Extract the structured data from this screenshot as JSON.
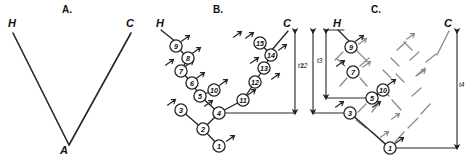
{
  "figure": {
    "caption_panels": [
      "A.",
      "B.",
      "C."
    ],
    "width": 471,
    "height": 166,
    "stroke_color": "#262626",
    "ghost_color": "#8c8c8c",
    "node_fill": "#ffffff"
  },
  "panelA": {
    "title": "A.",
    "title_pos": {
      "x": 62,
      "y": 6
    },
    "taxa": [
      {
        "name": "H",
        "x": 8,
        "y": 18
      },
      {
        "name": "C",
        "x": 126,
        "y": 18
      }
    ],
    "root": {
      "name": "A",
      "x": 64,
      "y": 148
    },
    "edges": [
      {
        "x1": 13,
        "y1": 33,
        "x2": 69,
        "y2": 145
      },
      {
        "x1": 69,
        "y1": 145,
        "x2": 131,
        "y2": 33
      }
    ]
  },
  "panelB": {
    "title": "B.",
    "title_pos": {
      "x": 213,
      "y": 6
    },
    "taxa": [
      {
        "name": "H",
        "x": 156,
        "y": 18
      },
      {
        "name": "C",
        "x": 283,
        "y": 18
      }
    ],
    "time_arrows": [
      {
        "label": "t1",
        "x": 295,
        "y_top": 30,
        "y_bottom": 113,
        "label_x": 298,
        "label_y": 66
      }
    ],
    "baseline": {
      "x1": 219,
      "y1": 113,
      "x2": 295,
      "y2": 113
    },
    "nodes": [
      {
        "id": 1,
        "x": 219,
        "y": 146
      },
      {
        "id": 2,
        "x": 203,
        "y": 129
      },
      {
        "id": 3,
        "x": 181,
        "y": 110
      },
      {
        "id": 4,
        "x": 219,
        "y": 113
      },
      {
        "id": 5,
        "x": 200,
        "y": 96
      },
      {
        "id": 6,
        "x": 192,
        "y": 83
      },
      {
        "id": 7,
        "x": 181,
        "y": 71
      },
      {
        "id": 8,
        "x": 188,
        "y": 58
      },
      {
        "id": 9,
        "x": 176,
        "y": 46
      },
      {
        "id": 10,
        "x": 214,
        "y": 90
      },
      {
        "id": 11,
        "x": 243,
        "y": 100
      },
      {
        "id": 12,
        "x": 255,
        "y": 82
      },
      {
        "id": 13,
        "x": 264,
        "y": 68
      },
      {
        "id": 14,
        "x": 271,
        "y": 55
      },
      {
        "id": 15,
        "x": 260,
        "y": 43
      }
    ],
    "edges": [
      {
        "from": 1,
        "to": 2
      },
      {
        "from": 2,
        "to": 3
      },
      {
        "from": 2,
        "to": 4
      },
      {
        "from": 4,
        "to": 5
      },
      {
        "from": 4,
        "to": 11
      },
      {
        "from": 5,
        "to": 6
      },
      {
        "from": 5,
        "to": 10
      },
      {
        "from": 6,
        "to": 7
      },
      {
        "from": 7,
        "to": 8
      },
      {
        "from": 8,
        "to": 9
      },
      {
        "from": 11,
        "to": 12
      },
      {
        "from": 12,
        "to": 13
      },
      {
        "from": 13,
        "to": 14
      },
      {
        "from": 14,
        "to": 15
      }
    ],
    "tip_edges": [
      {
        "x1": 176,
        "y1": 42,
        "x2": 161,
        "y2": 30,
        "leads_to": "H"
      },
      {
        "x1": 271,
        "y1": 51,
        "x2": 288,
        "y2": 31,
        "leads_to": "C"
      }
    ],
    "ticks": [
      {
        "x": 186,
        "y": 38
      },
      {
        "x": 197,
        "y": 50
      },
      {
        "x": 190,
        "y": 63
      },
      {
        "x": 201,
        "y": 75
      },
      {
        "x": 170,
        "y": 62
      },
      {
        "x": 172,
        "y": 102
      },
      {
        "x": 224,
        "y": 82
      },
      {
        "x": 209,
        "y": 103
      },
      {
        "x": 231,
        "y": 138
      },
      {
        "x": 252,
        "y": 92
      },
      {
        "x": 250,
        "y": 35
      },
      {
        "x": 276,
        "y": 76
      },
      {
        "x": 255,
        "y": 60
      },
      {
        "x": 283,
        "y": 47
      },
      {
        "x": 238,
        "y": 34
      }
    ]
  },
  "panelC": {
    "title": "C.",
    "title_pos": {
      "x": 371,
      "y": 6
    },
    "taxa": [
      {
        "name": "H",
        "x": 333,
        "y": 18
      },
      {
        "name": "C",
        "x": 444,
        "y": 18
      }
    ],
    "time_arrows": [
      {
        "label": "t2",
        "x": 313,
        "y_top": 30,
        "y_bottom": 113,
        "label_x": 303,
        "label_y": 66
      },
      {
        "label": "t3",
        "x": 326,
        "y_top": 30,
        "y_bottom": 98,
        "label_x": 318,
        "label_y": 61
      },
      {
        "label": "t4",
        "x": 457,
        "y_top": 30,
        "y_bottom": 148,
        "label_x": 459,
        "label_y": 85
      }
    ],
    "baselines": [
      {
        "x1": 313,
        "y1": 113,
        "x2": 350,
        "y2": 113
      },
      {
        "x1": 326,
        "y1": 98,
        "x2": 372,
        "y2": 98
      },
      {
        "x1": 390,
        "y1": 148,
        "x2": 457,
        "y2": 148
      },
      {
        "x1": 326,
        "y1": 30,
        "x2": 344,
        "y2": 30
      }
    ],
    "nodes": [
      {
        "id": 1,
        "x": 390,
        "y": 148
      },
      {
        "id": 3,
        "x": 350,
        "y": 113
      },
      {
        "id": 5,
        "x": 372,
        "y": 98
      },
      {
        "id": 7,
        "x": 353,
        "y": 72
      },
      {
        "id": 9,
        "x": 351,
        "y": 47
      },
      {
        "id": 10,
        "x": 383,
        "y": 90
      }
    ],
    "edges": [
      {
        "from": 1,
        "to": 3
      },
      {
        "from": 5,
        "to": 10
      }
    ],
    "tip_edges": [
      {
        "x1": 351,
        "y1": 43,
        "x2": 338,
        "y2": 30,
        "leads_to": "H"
      },
      {
        "x1": 437,
        "y1": 55,
        "x2": 449,
        "y2": 31,
        "leads_to": "C"
      }
    ],
    "ghost_segments": [
      {
        "x1": 357,
        "y1": 51,
        "x2": 366,
        "y2": 60
      },
      {
        "x1": 343,
        "y1": 52,
        "x2": 335,
        "y2": 60
      },
      {
        "x1": 345,
        "y1": 66,
        "x2": 337,
        "y2": 59
      },
      {
        "x1": 360,
        "y1": 66,
        "x2": 369,
        "y2": 58
      },
      {
        "x1": 347,
        "y1": 78,
        "x2": 340,
        "y2": 86
      },
      {
        "x1": 360,
        "y1": 78,
        "x2": 367,
        "y2": 86
      },
      {
        "x1": 378,
        "y1": 104,
        "x2": 372,
        "y2": 112
      },
      {
        "x1": 366,
        "y1": 104,
        "x2": 358,
        "y2": 112
      },
      {
        "x1": 356,
        "y1": 120,
        "x2": 366,
        "y2": 128
      },
      {
        "x1": 372,
        "y1": 132,
        "x2": 384,
        "y2": 143
      },
      {
        "x1": 395,
        "y1": 142,
        "x2": 404,
        "y2": 132
      },
      {
        "x1": 408,
        "y1": 128,
        "x2": 418,
        "y2": 118
      },
      {
        "x1": 421,
        "y1": 114,
        "x2": 430,
        "y2": 104
      },
      {
        "x1": 401,
        "y1": 110,
        "x2": 392,
        "y2": 100
      },
      {
        "x1": 389,
        "y1": 96,
        "x2": 381,
        "y2": 88
      },
      {
        "x1": 412,
        "y1": 96,
        "x2": 421,
        "y2": 88
      },
      {
        "x1": 404,
        "y1": 82,
        "x2": 396,
        "y2": 74
      },
      {
        "x1": 416,
        "y1": 76,
        "x2": 425,
        "y2": 68
      },
      {
        "x1": 399,
        "y1": 66,
        "x2": 391,
        "y2": 58
      },
      {
        "x1": 410,
        "y1": 60,
        "x2": 419,
        "y2": 52
      },
      {
        "x1": 397,
        "y1": 50,
        "x2": 406,
        "y2": 42
      },
      {
        "x1": 404,
        "y1": 42,
        "x2": 412,
        "y2": 50
      },
      {
        "x1": 426,
        "y1": 62,
        "x2": 436,
        "y2": 54
      },
      {
        "x1": 391,
        "y1": 78,
        "x2": 383,
        "y2": 70
      }
    ],
    "ghost_ticks": [
      {
        "x": 363,
        "y": 41
      },
      {
        "x": 367,
        "y": 64
      },
      {
        "x": 411,
        "y": 36
      },
      {
        "x": 422,
        "y": 72
      },
      {
        "x": 396,
        "y": 116
      },
      {
        "x": 385,
        "y": 134
      }
    ],
    "ticks": [
      {
        "x": 360,
        "y": 38
      },
      {
        "x": 341,
        "y": 63
      },
      {
        "x": 392,
        "y": 82
      },
      {
        "x": 377,
        "y": 104
      },
      {
        "x": 340,
        "y": 104
      },
      {
        "x": 400,
        "y": 140
      }
    ]
  }
}
